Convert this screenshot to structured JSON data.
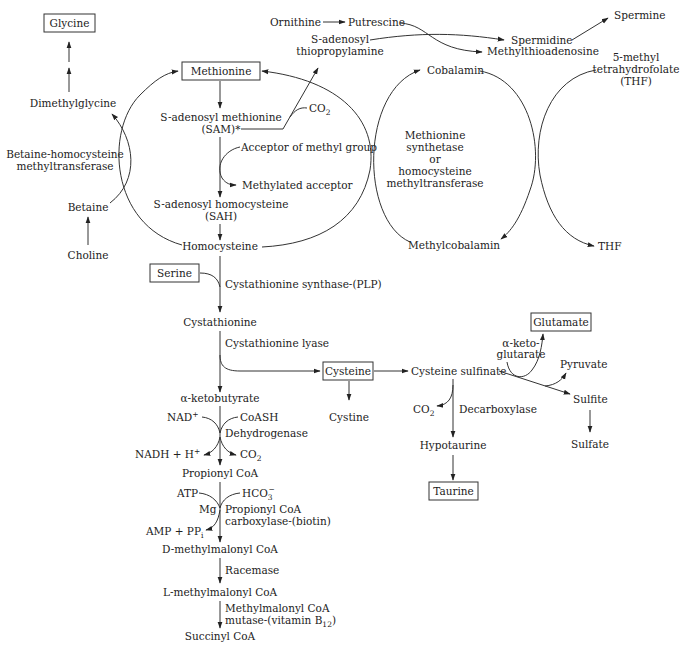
{
  "nodes": {
    "glycine": "Glycine",
    "dimethylglycine": "Dimethylglycine",
    "bhmt_1": "Betaine-homocysteine",
    "bhmt_2": "methyltransferase",
    "betaine": "Betaine",
    "choline": "Choline",
    "methionine": "Methionine",
    "sam_1": "S-adenosyl methionine",
    "sam_2": "(SAM)*",
    "co2_sam": "CO",
    "co2_sam_sub": "2",
    "acceptor": "Acceptor of methyl group",
    "methylated_acceptor": "Methylated acceptor",
    "sah_1": "S-adenosyl homocysteine",
    "sah_2": "(SAH)",
    "homocysteine": "Homocysteine",
    "ornithine": "Ornithine",
    "putrescine": "Putrescine",
    "sadtp_1": "S-adenosyl",
    "sadtp_2": "thiopropylamine",
    "spermidine": "Spermidine",
    "mta": "Methylthioadenosine",
    "spermine": "Spermine",
    "cobalamin": "Cobalamin",
    "ms_1": "Methionine",
    "ms_2": "synthetase",
    "ms_3": "or",
    "ms_4": "homocysteine",
    "ms_5": "methyltransferase",
    "methylcobalamin": "Methylcobalamin",
    "mthf_1": "5-methyl",
    "mthf_2": "tetrahydrofolate",
    "mthf_3": "(THF)",
    "thf": "THF",
    "serine": "Serine",
    "cbs": "Cystathionine synthase-(PLP)",
    "cystathionine": "Cystathionine",
    "cgl": "Cystathionine lyase",
    "cysteine": "Cysteine",
    "cystine": "Cystine",
    "cysteine_sulfinate": "Cysteine sulfinate",
    "akg_1": "α-keto-",
    "akg_2": "glutarate",
    "glutamate": "Glutamate",
    "pyruvate": "Pyruvate",
    "sulfite": "Sulfite",
    "sulfate": "Sulfate",
    "co2_decarb": "CO",
    "co2_decarb_sub": "2",
    "decarboxylase": "Decarboxylase",
    "hypotaurine": "Hypotaurine",
    "taurine": "Taurine",
    "akb": "α-ketobutyrate",
    "nad": "NAD",
    "nad_sup": "+",
    "coash": "CoASH",
    "dehydrogenase": "Dehydrogenase",
    "nadh": "NADH + H",
    "nadh_sup": "+",
    "co2_dh": "CO",
    "co2_dh_sub": "2",
    "propionyl_coa": "Propionyl CoA",
    "atp": "ATP",
    "hco3": "HCO",
    "hco3_sub": "3",
    "hco3_sup": "−",
    "mg": "Mg",
    "pcc_1": "Propionyl CoA",
    "pcc_2": "carboxylase-(biotin)",
    "amp": "AMP + PP",
    "amp_sub": "i",
    "d_mmcoa": "D-methylmalonyl CoA",
    "racemase": "Racemase",
    "l_mmcoa": "L-methylmalonyl CoA",
    "mcm_1": "Methylmalonyl CoA",
    "mcm_2": "mutase-(vitamin B",
    "mcm_2_sub": "12",
    "mcm_2_end": ")",
    "succinyl_coa": "Succinyl CoA"
  },
  "boxed_nodes": [
    "Glycine",
    "Methionine",
    "Serine",
    "Cysteine",
    "Glutamate",
    "Taurine"
  ]
}
